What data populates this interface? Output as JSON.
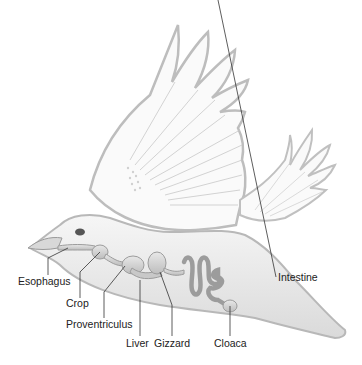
{
  "diagram": {
    "labels": [
      {
        "id": "esophagus",
        "text": "Esophagus"
      },
      {
        "id": "crop",
        "text": "Crop"
      },
      {
        "id": "proventriculus",
        "text": "Proventriculus"
      },
      {
        "id": "liver",
        "text": "Liver"
      },
      {
        "id": "gizzard",
        "text": "Gizzard"
      },
      {
        "id": "intestine",
        "text": "Intestine"
      },
      {
        "id": "cloaca",
        "text": "Cloaca"
      }
    ]
  }
}
